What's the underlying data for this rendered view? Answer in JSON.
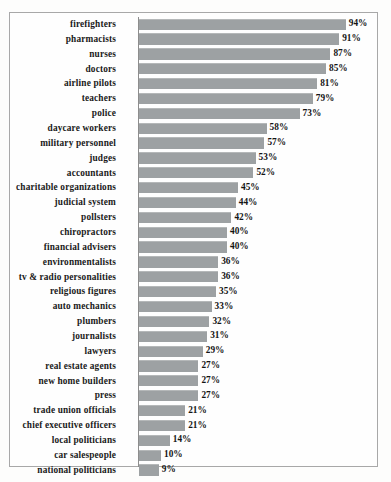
{
  "chart_data": {
    "type": "bar",
    "orientation": "horizontal",
    "title": "",
    "subtitle": "",
    "xlabel": "",
    "ylabel": "",
    "xlim": [
      0,
      100
    ],
    "grid": false,
    "legend": false,
    "value_suffix": "%",
    "bar_color": "#9da1a3",
    "frame_color": "#a8a8a8",
    "background_color": "#fdfdfc",
    "categories": [
      "firefighters",
      "pharmacists",
      "nurses",
      "doctors",
      "airline pilots",
      "teachers",
      "police",
      "daycare workers",
      "military personnel",
      "judges",
      "accountants",
      "charitable organizations",
      "judicial system",
      "pollsters",
      "chiropractors",
      "financial advisers",
      "environmentalists",
      "tv & radio personalities",
      "religious figures",
      "auto mechanics",
      "plumbers",
      "journalists",
      "lawyers",
      "real estate agents",
      "new home builders",
      "press",
      "trade union officials",
      "chief executive officers",
      "local politicians",
      "car salespeople",
      "national politicians"
    ],
    "values": [
      94,
      91,
      87,
      85,
      81,
      79,
      73,
      58,
      57,
      53,
      52,
      45,
      44,
      42,
      40,
      40,
      36,
      36,
      35,
      33,
      32,
      31,
      29,
      27,
      27,
      27,
      21,
      21,
      14,
      10,
      9
    ],
    "value_labels": [
      "94%",
      "91%",
      "87%",
      "85%",
      "81%",
      "79%",
      "73%",
      "58%",
      "57%",
      "53%",
      "52%",
      "45%",
      "44%",
      "42%",
      "40%",
      "40%",
      "36%",
      "36%",
      "35%",
      "33%",
      "32%",
      "31%",
      "29%",
      "27%",
      "27%",
      "27%",
      "21%",
      "21%",
      "14%",
      "10%",
      "9%"
    ]
  }
}
